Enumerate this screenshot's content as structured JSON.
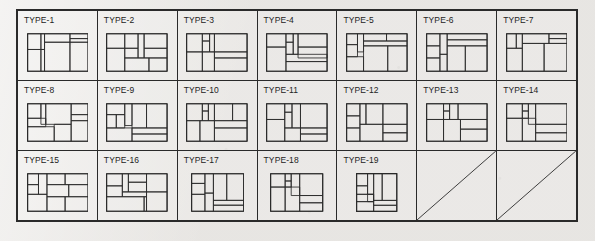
{
  "page": {
    "kind": "scanned-document-figure",
    "background_color": "#eceae7",
    "ink_color": "#2a2a2a"
  },
  "table": {
    "columns": 7,
    "rows": 3,
    "total_cells": 21,
    "filled_cells": 19,
    "empty_cells": 2,
    "empty_cell_marker": "diagonal-slash"
  },
  "cells": [
    {
      "label": "TYPE-1",
      "diagram": "floor-plan-partition",
      "viewbox": [
        0,
        0,
        100,
        62
      ],
      "rects": [
        [
          0,
          0,
          100,
          62
        ],
        [
          0,
          0,
          22,
          26
        ],
        [
          22,
          0,
          6,
          26
        ],
        [
          28,
          0,
          42,
          14
        ],
        [
          70,
          0,
          30,
          8
        ],
        [
          70,
          8,
          30,
          6
        ],
        [
          28,
          14,
          42,
          48
        ],
        [
          70,
          14,
          30,
          48
        ],
        [
          0,
          26,
          22,
          36
        ],
        [
          22,
          26,
          6,
          36
        ]
      ],
      "lines": []
    },
    {
      "label": "TYPE-2",
      "diagram": "floor-plan-partition",
      "viewbox": [
        0,
        0,
        100,
        62
      ],
      "rects": [
        [
          0,
          0,
          100,
          62
        ],
        [
          0,
          0,
          30,
          24
        ],
        [
          30,
          0,
          22,
          24
        ],
        [
          52,
          0,
          10,
          40
        ],
        [
          62,
          0,
          38,
          24
        ],
        [
          0,
          24,
          30,
          38
        ],
        [
          30,
          24,
          22,
          16
        ],
        [
          62,
          24,
          38,
          16
        ],
        [
          30,
          40,
          40,
          22
        ],
        [
          70,
          40,
          30,
          22
        ]
      ],
      "lines": []
    },
    {
      "label": "TYPE-3",
      "diagram": "floor-plan-partition",
      "viewbox": [
        0,
        0,
        100,
        62
      ],
      "rects": [
        [
          0,
          0,
          100,
          62
        ],
        [
          0,
          0,
          26,
          30
        ],
        [
          26,
          0,
          12,
          12
        ],
        [
          38,
          0,
          8,
          30
        ],
        [
          46,
          0,
          54,
          30
        ],
        [
          26,
          12,
          12,
          18
        ],
        [
          0,
          30,
          26,
          32
        ],
        [
          26,
          30,
          20,
          32
        ],
        [
          46,
          30,
          54,
          10
        ],
        [
          46,
          40,
          54,
          22
        ]
      ],
      "lines": []
    },
    {
      "label": "TYPE-4",
      "diagram": "floor-plan-partition",
      "viewbox": [
        0,
        0,
        100,
        62
      ],
      "rects": [
        [
          0,
          0,
          100,
          62
        ],
        [
          0,
          0,
          32,
          22
        ],
        [
          32,
          0,
          12,
          14
        ],
        [
          44,
          0,
          8,
          34
        ],
        [
          52,
          0,
          48,
          22
        ],
        [
          32,
          14,
          12,
          20
        ],
        [
          0,
          22,
          32,
          40
        ],
        [
          52,
          22,
          48,
          18
        ],
        [
          32,
          34,
          68,
          12
        ],
        [
          32,
          46,
          68,
          16
        ]
      ],
      "lines": []
    },
    {
      "label": "TYPE-5",
      "diagram": "floor-plan-partition",
      "viewbox": [
        0,
        0,
        100,
        62
      ],
      "rects": [
        [
          0,
          0,
          100,
          62
        ],
        [
          0,
          0,
          18,
          18
        ],
        [
          18,
          0,
          10,
          30
        ],
        [
          28,
          0,
          38,
          12
        ],
        [
          66,
          0,
          34,
          12
        ],
        [
          28,
          12,
          72,
          8
        ],
        [
          0,
          18,
          18,
          20
        ],
        [
          28,
          20,
          40,
          42
        ],
        [
          68,
          20,
          32,
          42
        ],
        [
          0,
          38,
          28,
          24
        ]
      ],
      "lines": []
    },
    {
      "label": "TYPE-6",
      "diagram": "floor-plan-partition",
      "viewbox": [
        0,
        0,
        100,
        62
      ],
      "rects": [
        [
          0,
          0,
          100,
          62
        ],
        [
          0,
          0,
          22,
          20
        ],
        [
          22,
          0,
          12,
          34
        ],
        [
          34,
          0,
          66,
          10
        ],
        [
          34,
          10,
          66,
          10
        ],
        [
          0,
          20,
          22,
          20
        ],
        [
          34,
          20,
          30,
          42
        ],
        [
          64,
          20,
          36,
          42
        ],
        [
          22,
          34,
          12,
          28
        ],
        [
          0,
          40,
          22,
          22
        ]
      ],
      "lines": []
    },
    {
      "label": "TYPE-7",
      "diagram": "floor-plan-partition",
      "viewbox": [
        0,
        0,
        100,
        62
      ],
      "rects": [
        [
          0,
          0,
          100,
          62
        ],
        [
          0,
          0,
          16,
          24
        ],
        [
          16,
          0,
          10,
          24
        ],
        [
          26,
          0,
          44,
          16
        ],
        [
          70,
          0,
          30,
          8
        ],
        [
          70,
          8,
          30,
          8
        ],
        [
          0,
          24,
          26,
          38
        ],
        [
          26,
          16,
          36,
          46
        ],
        [
          62,
          16,
          38,
          46
        ]
      ],
      "lines": []
    },
    {
      "label": "TYPE-8",
      "diagram": "floor-plan-partition",
      "viewbox": [
        0,
        0,
        100,
        62
      ],
      "rects": [
        [
          0,
          0,
          100,
          62
        ],
        [
          0,
          0,
          22,
          24
        ],
        [
          22,
          0,
          8,
          34
        ],
        [
          30,
          0,
          42,
          34
        ],
        [
          72,
          0,
          28,
          18
        ],
        [
          72,
          18,
          28,
          10
        ],
        [
          0,
          24,
          30,
          14
        ],
        [
          0,
          38,
          44,
          24
        ],
        [
          44,
          34,
          28,
          28
        ],
        [
          72,
          28,
          28,
          34
        ]
      ],
      "lines": []
    },
    {
      "label": "TYPE-9",
      "diagram": "floor-plan-partition",
      "viewbox": [
        0,
        0,
        100,
        62
      ],
      "rects": [
        [
          0,
          0,
          100,
          62
        ],
        [
          0,
          0,
          30,
          18
        ],
        [
          30,
          0,
          12,
          36
        ],
        [
          42,
          0,
          24,
          40
        ],
        [
          66,
          0,
          34,
          40
        ],
        [
          0,
          18,
          16,
          22
        ],
        [
          16,
          18,
          14,
          22
        ],
        [
          0,
          40,
          42,
          22
        ],
        [
          42,
          40,
          58,
          10
        ],
        [
          42,
          50,
          58,
          12
        ]
      ],
      "lines": []
    },
    {
      "label": "TYPE-10",
      "diagram": "floor-plan-partition",
      "viewbox": [
        0,
        0,
        100,
        62
      ],
      "rects": [
        [
          0,
          0,
          100,
          62
        ],
        [
          0,
          0,
          26,
          28
        ],
        [
          26,
          0,
          10,
          12
        ],
        [
          36,
          0,
          10,
          28
        ],
        [
          46,
          0,
          30,
          28
        ],
        [
          76,
          0,
          24,
          28
        ],
        [
          26,
          12,
          10,
          16
        ],
        [
          0,
          28,
          22,
          34
        ],
        [
          22,
          28,
          24,
          34
        ],
        [
          46,
          28,
          54,
          12
        ],
        [
          46,
          40,
          54,
          22
        ]
      ],
      "lines": []
    },
    {
      "label": "TYPE-11",
      "diagram": "floor-plan-partition",
      "viewbox": [
        0,
        0,
        100,
        62
      ],
      "rects": [
        [
          0,
          0,
          100,
          62
        ],
        [
          0,
          0,
          30,
          26
        ],
        [
          30,
          0,
          12,
          14
        ],
        [
          42,
          0,
          14,
          40
        ],
        [
          56,
          0,
          44,
          40
        ],
        [
          30,
          14,
          12,
          26
        ],
        [
          0,
          26,
          30,
          36
        ],
        [
          30,
          40,
          26,
          22
        ],
        [
          56,
          40,
          44,
          10
        ],
        [
          56,
          50,
          44,
          12
        ]
      ],
      "lines": []
    },
    {
      "label": "TYPE-12",
      "diagram": "floor-plan-partition",
      "viewbox": [
        0,
        0,
        100,
        62
      ],
      "rects": [
        [
          0,
          0,
          100,
          62
        ],
        [
          0,
          0,
          22,
          20
        ],
        [
          22,
          0,
          10,
          34
        ],
        [
          32,
          0,
          28,
          34
        ],
        [
          60,
          0,
          40,
          34
        ],
        [
          0,
          20,
          22,
          20
        ],
        [
          22,
          34,
          38,
          28
        ],
        [
          60,
          34,
          40,
          14
        ],
        [
          60,
          48,
          40,
          14
        ],
        [
          0,
          40,
          22,
          22
        ]
      ],
      "lines": []
    },
    {
      "label": "TYPE-13",
      "diagram": "floor-plan-partition",
      "viewbox": [
        0,
        0,
        100,
        62
      ],
      "rects": [
        [
          0,
          0,
          100,
          62
        ],
        [
          0,
          0,
          28,
          26
        ],
        [
          28,
          0,
          10,
          12
        ],
        [
          38,
          0,
          14,
          26
        ],
        [
          52,
          0,
          48,
          26
        ],
        [
          28,
          12,
          10,
          14
        ],
        [
          0,
          26,
          28,
          36
        ],
        [
          28,
          26,
          28,
          36
        ],
        [
          56,
          26,
          44,
          16
        ],
        [
          56,
          42,
          44,
          20
        ]
      ],
      "lines": []
    },
    {
      "label": "TYPE-14",
      "diagram": "floor-plan-partition",
      "viewbox": [
        0,
        0,
        100,
        62
      ],
      "rects": [
        [
          0,
          0,
          100,
          62
        ],
        [
          0,
          0,
          26,
          24
        ],
        [
          26,
          0,
          10,
          12
        ],
        [
          36,
          0,
          12,
          34
        ],
        [
          48,
          0,
          52,
          34
        ],
        [
          26,
          12,
          10,
          12
        ],
        [
          0,
          24,
          26,
          38
        ],
        [
          26,
          24,
          22,
          38
        ],
        [
          48,
          34,
          52,
          14
        ],
        [
          48,
          48,
          52,
          14
        ]
      ],
      "lines": []
    },
    {
      "label": "TYPE-15",
      "diagram": "floor-plan-partition",
      "viewbox": [
        0,
        0,
        100,
        62
      ],
      "rects": [
        [
          0,
          0,
          100,
          62
        ],
        [
          0,
          0,
          18,
          18
        ],
        [
          18,
          0,
          14,
          34
        ],
        [
          32,
          0,
          30,
          18
        ],
        [
          62,
          0,
          38,
          18
        ],
        [
          0,
          18,
          18,
          16
        ],
        [
          32,
          18,
          36,
          20
        ],
        [
          68,
          18,
          32,
          20
        ],
        [
          0,
          34,
          32,
          28
        ],
        [
          32,
          38,
          30,
          24
        ],
        [
          62,
          38,
          38,
          24
        ]
      ],
      "lines": []
    },
    {
      "label": "TYPE-16",
      "diagram": "floor-plan-partition",
      "viewbox": [
        0,
        0,
        100,
        62
      ],
      "rects": [
        [
          0,
          0,
          100,
          62
        ],
        [
          0,
          0,
          26,
          20
        ],
        [
          26,
          0,
          10,
          30
        ],
        [
          36,
          0,
          30,
          14
        ],
        [
          66,
          0,
          34,
          30
        ],
        [
          36,
          14,
          30,
          16
        ],
        [
          0,
          20,
          26,
          18
        ],
        [
          0,
          38,
          62,
          24
        ],
        [
          26,
          30,
          40,
          8
        ],
        [
          66,
          30,
          34,
          32
        ],
        [
          62,
          38,
          4,
          24
        ]
      ],
      "lines": []
    },
    {
      "label": "TYPE-17",
      "diagram": "floor-plan-partition",
      "viewbox": [
        0,
        0,
        86,
        62
      ],
      "rects": [
        [
          0,
          0,
          86,
          62
        ],
        [
          0,
          0,
          22,
          16
        ],
        [
          22,
          0,
          14,
          32
        ],
        [
          36,
          0,
          22,
          44
        ],
        [
          58,
          0,
          28,
          44
        ],
        [
          0,
          16,
          22,
          18
        ],
        [
          0,
          34,
          22,
          28
        ],
        [
          22,
          32,
          14,
          30
        ],
        [
          36,
          44,
          50,
          8
        ],
        [
          36,
          52,
          50,
          10
        ]
      ],
      "lines": []
    },
    {
      "label": "TYPE-18",
      "diagram": "floor-plan-partition",
      "viewbox": [
        0,
        0,
        86,
        62
      ],
      "rects": [
        [
          0,
          0,
          86,
          62
        ],
        [
          0,
          0,
          24,
          22
        ],
        [
          24,
          0,
          10,
          12
        ],
        [
          34,
          0,
          14,
          36
        ],
        [
          48,
          0,
          38,
          36
        ],
        [
          24,
          12,
          10,
          10
        ],
        [
          0,
          22,
          24,
          40
        ],
        [
          24,
          22,
          24,
          40
        ],
        [
          48,
          36,
          38,
          12
        ],
        [
          48,
          48,
          38,
          14
        ]
      ],
      "lines": []
    },
    {
      "label": "TYPE-19",
      "diagram": "floor-plan-partition",
      "viewbox": [
        0,
        0,
        66,
        62
      ],
      "rects": [
        [
          0,
          0,
          66,
          62
        ],
        [
          0,
          0,
          18,
          20
        ],
        [
          18,
          0,
          10,
          34
        ],
        [
          28,
          0,
          14,
          44
        ],
        [
          42,
          0,
          24,
          44
        ],
        [
          0,
          20,
          18,
          14
        ],
        [
          0,
          34,
          28,
          12
        ],
        [
          0,
          46,
          28,
          16
        ],
        [
          18,
          34,
          10,
          12
        ],
        [
          28,
          44,
          38,
          8
        ],
        [
          28,
          52,
          38,
          10
        ]
      ],
      "lines": []
    },
    {
      "label": "",
      "diagram": "empty-slash",
      "viewbox": [
        0,
        0,
        100,
        62
      ],
      "rects": [],
      "lines": [
        [
          0,
          62,
          100,
          0
        ]
      ]
    },
    {
      "label": "",
      "diagram": "empty-slash",
      "viewbox": [
        0,
        0,
        100,
        62
      ],
      "rects": [],
      "lines": [
        [
          0,
          62,
          100,
          0
        ]
      ]
    }
  ]
}
